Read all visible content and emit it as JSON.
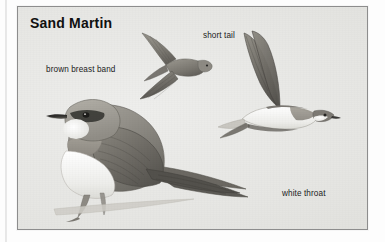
{
  "panel": {
    "title": "Sand Martin",
    "background_color": "#e9e9e6",
    "border_color": "#8d8d8d",
    "text_color": "#1b1b1b"
  },
  "labels": {
    "brown_breast_band": "brown breast band",
    "short_tail": "short tail",
    "white_throat": "white throat"
  },
  "illustration": {
    "subject": "Sand Martin (Riparia riparia)",
    "figures": [
      {
        "name": "perched-bird",
        "pose": "perched on branch, facing left",
        "features": [
          "brown upperparts",
          "white throat",
          "brown breast band",
          "dark eye",
          "short dark bill",
          "long pointed wings",
          "short forked tail"
        ]
      },
      {
        "name": "flying-bird-small",
        "pose": "in flight, upperside view, wings raised",
        "features": [
          "brown upperparts",
          "short forked tail",
          "pointed wings"
        ]
      },
      {
        "name": "flying-bird-large",
        "pose": "in flight, underside view, wings raised",
        "features": [
          "white underparts",
          "brown breast band",
          "white throat",
          "dark underwing",
          "short forked tail"
        ]
      }
    ],
    "palette": {
      "plumage_dark": "#6f6d68",
      "plumage_mid": "#8d8a84",
      "plumage_light": "#aaa79f",
      "underpart_white": "#f4f4f1",
      "outline": "#4b4a47"
    }
  }
}
